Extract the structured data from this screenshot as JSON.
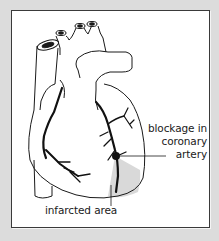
{
  "figure": {
    "labels": {
      "blockage": [
        "blockage in",
        "coronary",
        "artery"
      ],
      "infarct": "infarcted area"
    },
    "colors": {
      "background": "#dcdcdc",
      "panel": "#ffffff",
      "outline": "#1a1a1a",
      "infarct_shade": "#d9d9d9",
      "border": "#3a3a3a"
    }
  }
}
